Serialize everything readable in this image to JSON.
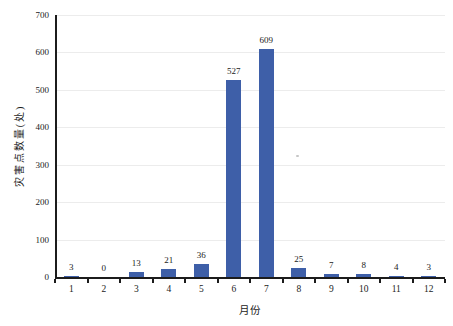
{
  "chart_data": {
    "type": "bar",
    "title": "",
    "xlabel": "月份",
    "ylabel": "灾害点数量(处)",
    "categories": [
      "1",
      "2",
      "3",
      "4",
      "5",
      "6",
      "7",
      "8",
      "9",
      "10",
      "11",
      "12"
    ],
    "values": [
      3,
      0,
      13,
      21,
      36,
      527,
      609,
      25,
      7,
      8,
      4,
      3
    ],
    "data_labels": [
      "3",
      "0",
      "13",
      "21",
      "36",
      "527",
      "609",
      "25",
      "7",
      "8",
      "4",
      "3"
    ],
    "ylim": [
      0,
      700
    ],
    "yticks": [
      0,
      100,
      200,
      300,
      400,
      500,
      600,
      700
    ],
    "bar_color": "#3E5FA8",
    "axis_color": "#1c1c1c",
    "gridline_color": "#ececec",
    "grid": "horizontal-faint",
    "legend": "none"
  }
}
